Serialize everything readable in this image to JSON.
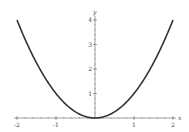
{
  "chart_data": {
    "type": "line",
    "title": "",
    "xlabel": "x",
    "ylabel": "y",
    "xlim": [
      -2,
      2
    ],
    "ylim": [
      0,
      4
    ],
    "xticks": [
      -2,
      -1,
      0,
      1,
      2
    ],
    "xtick_labels": [
      "-2",
      "-1",
      "",
      "1",
      "2"
    ],
    "yticks": [
      1,
      2,
      3,
      4
    ],
    "ytick_labels": [
      "1",
      "2",
      "3",
      "4"
    ],
    "grid": false,
    "legend": null,
    "series": [
      {
        "name": "y = x^2",
        "color": "#333333",
        "x": [
          -2,
          -1.5,
          -1,
          -0.5,
          0,
          0.5,
          1,
          1.5,
          2
        ],
        "y": [
          4,
          2.25,
          1,
          0.25,
          0,
          0.25,
          1,
          2.25,
          4
        ]
      }
    ]
  },
  "labels": {
    "x": "x",
    "y": "y"
  },
  "ticks": {
    "x": [
      {
        "value": -2,
        "label": "-2"
      },
      {
        "value": -1,
        "label": "-1"
      },
      {
        "value": 1,
        "label": "1"
      },
      {
        "value": 2,
        "label": "2"
      }
    ],
    "y": [
      {
        "value": 1,
        "label": "1"
      },
      {
        "value": 2,
        "label": "2"
      },
      {
        "value": 3,
        "label": "3"
      },
      {
        "value": 4,
        "label": "4"
      }
    ]
  }
}
